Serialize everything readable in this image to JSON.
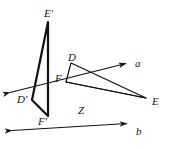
{
  "figure": {
    "background_color": "#ffffff",
    "ink_color": "#111111",
    "stroke_widths": {
      "axis": 1.1,
      "triangle_image": 2.2,
      "triangle_source": 1.2
    },
    "labels": [
      {
        "id": "E-prime",
        "text": "E'",
        "x": 44,
        "y": 8
      },
      {
        "id": "D",
        "text": "D",
        "x": 68,
        "y": 52
      },
      {
        "id": "F",
        "text": "F",
        "x": 55,
        "y": 73
      },
      {
        "id": "a",
        "text": "a",
        "x": 135,
        "y": 58
      },
      {
        "id": "E",
        "text": "E",
        "x": 152,
        "y": 96
      },
      {
        "id": "D-prime",
        "text": "D'",
        "x": 17,
        "y": 94
      },
      {
        "id": "Z",
        "text": "Z",
        "x": 78,
        "y": 105
      },
      {
        "id": "F-prime",
        "text": "F'",
        "x": 38,
        "y": 116
      },
      {
        "id": "b",
        "text": "b",
        "x": 136,
        "y": 126
      }
    ],
    "points": {
      "E_prime": {
        "x": 48,
        "y": 22
      },
      "D_prime": {
        "x": 32,
        "y": 100
      },
      "F_prime": {
        "x": 48,
        "y": 116
      },
      "D": {
        "x": 71,
        "y": 63
      },
      "F": {
        "x": 66,
        "y": 82
      },
      "E": {
        "x": 146,
        "y": 98
      },
      "Z": {
        "x": 72,
        "y": 100
      }
    },
    "lines": [
      {
        "id": "axis-a",
        "from": {
          "x": 4,
          "y": 94
        },
        "to": {
          "x": 132,
          "y": 62
        },
        "arrows": "both",
        "label": "a"
      },
      {
        "id": "axis-b",
        "from": {
          "x": 6,
          "y": 131
        },
        "to": {
          "x": 133,
          "y": 123
        },
        "arrows": "both",
        "label": "b"
      }
    ],
    "triangles": [
      {
        "id": "triangle-image",
        "vertices": [
          "E_prime",
          "D_prime",
          "F_prime"
        ],
        "emphasis": "bold"
      },
      {
        "id": "triangle-source",
        "vertices": [
          "D",
          "F",
          "E"
        ],
        "emphasis": "thin"
      }
    ]
  }
}
